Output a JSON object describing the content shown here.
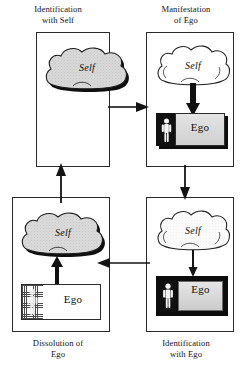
{
  "diagram": {
    "type": "cycle-diagram",
    "colors": {
      "stroke": "#2b2b2b",
      "fill_dark": "#0d0d0d",
      "fill_light": "#dcdcdc",
      "background": "#ffffff",
      "cloud_fill_shaded": "#d5d5d5",
      "cloud_fill_plain": "#ffffff"
    },
    "quadrants": [
      {
        "id": "top-left",
        "caption_line1": "Identification",
        "caption_line2": "with Self",
        "cloud_label": "Self",
        "cloud_style": "shaded-with-heavy-shadow",
        "ego_present": false,
        "internal_arrow": "none"
      },
      {
        "id": "top-right",
        "caption_line1": "Manifestation",
        "caption_line2": "of Ego",
        "cloud_label": "Self",
        "cloud_style": "plain-outline",
        "ego_present": true,
        "ego_label": "Ego",
        "ego_style": "dark-figure-panel-with-light-slab-and-shadow",
        "internal_arrow": "thick-down"
      },
      {
        "id": "bottom-right",
        "caption_line1": "Identification",
        "caption_line2": "with Ego",
        "cloud_label": "Self",
        "cloud_style": "plain-outline",
        "ego_present": true,
        "ego_label": "Ego",
        "ego_style": "thick-black-frame-enclosing-figure-and-slab",
        "internal_arrow": "thin-down"
      },
      {
        "id": "bottom-left",
        "caption_line1": "Dissolution of",
        "caption_line2": "Ego",
        "cloud_label": "Self",
        "cloud_style": "shaded-with-heavy-shadow",
        "ego_present": true,
        "ego_label": "Ego",
        "ego_style": "thin-outline-with-hatched-dissolving-figure",
        "internal_arrow": "thick-up"
      }
    ],
    "connectors": [
      {
        "id": "top",
        "from": "top-left",
        "to": "top-right",
        "direction": "right"
      },
      {
        "id": "right",
        "from": "top-right",
        "to": "bottom-right",
        "direction": "down"
      },
      {
        "id": "bottom",
        "from": "bottom-right",
        "to": "bottom-left",
        "direction": "left"
      },
      {
        "id": "left",
        "from": "bottom-left",
        "to": "top-left",
        "direction": "up"
      }
    ],
    "icons": {
      "cloud": "cloud-icon",
      "person": "person-figure-icon",
      "arrow_down": "arrow-down-icon",
      "arrow_up": "arrow-up-icon",
      "arrow_right": "arrow-right-icon",
      "arrow_left": "arrow-left-icon"
    }
  }
}
